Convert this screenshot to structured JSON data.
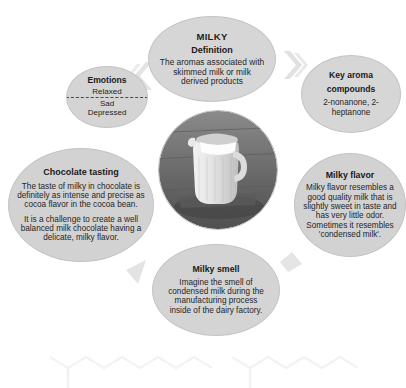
{
  "diagram": {
    "center": {
      "image_name": "milk-jug-photo",
      "alt": "Ceramic jug filled with milk on rustic wooden table"
    },
    "colors": {
      "bubble_fill": "#d4d4d4",
      "bubble_border": "#c4c4c4",
      "text": "#231f20",
      "divider": "#4a4a4a",
      "page_background": "#ffffff"
    },
    "nodes": {
      "milky": {
        "kicker": "MILKY",
        "title": "Definition",
        "body": "The aromas associated with skimmed milk or milk derived products"
      },
      "emotions": {
        "title": "Emotions",
        "positive": "Relaxed",
        "negative_1": "Sad",
        "negative_2": "Depressed"
      },
      "key_compounds": {
        "title_line_1": "Key aroma",
        "title_line_2": "compounds",
        "body": "2-nonanone, 2-heptanone"
      },
      "milky_flavor": {
        "title": "Milky flavor",
        "body": "Milky flavor resembles a good quality milk that is slightly sweet in taste and has very little odor. Sometimes it resembles 'condensed milk'."
      },
      "chocolate_tasting": {
        "title": "Chocolate tasting",
        "body_1": "The taste of milky in chocolate is definitely as intense and precise as cocoa flavor in the cocoa bean.",
        "body_2": "It is a challenge to create a well balanced milk chocolate having a delicate, milky flavor."
      },
      "milky_smell": {
        "title": "Milky smell",
        "body": "Imagine the smell of condensed milk during the manufacturing process inside of the dairy factory."
      }
    },
    "background_structures": [
      {
        "name": "2-nonanone-skeleton",
        "carbons": 9
      },
      {
        "name": "2-heptanone-skeleton",
        "carbons": 7
      }
    ]
  }
}
